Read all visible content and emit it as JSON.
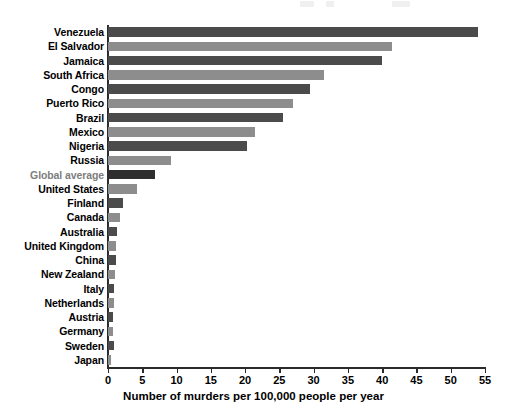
{
  "chart_data": {
    "type": "bar",
    "orientation": "horizontal",
    "title": "",
    "subtitle": "",
    "xlabel": "Number of murders per 100,000 people per year",
    "ylabel": "",
    "xlim": [
      0,
      55
    ],
    "xticks": [
      0,
      5,
      10,
      15,
      20,
      25,
      30,
      35,
      40,
      45,
      50,
      55
    ],
    "grid": false,
    "legend": "none",
    "categories": [
      "Venezuela",
      "El Salvador",
      "Jamaica",
      "South Africa",
      "Congo",
      "Puerto Rico",
      "Brazil",
      "Mexico",
      "Nigeria",
      "Russia",
      "Global average",
      "United States",
      "Finland",
      "Canada",
      "Australia",
      "United Kingdom",
      "China",
      "New Zealand",
      "Italy",
      "Netherlands",
      "Austria",
      "Germany",
      "Sweden",
      "Japan"
    ],
    "values": [
      54.0,
      41.5,
      40.0,
      31.5,
      29.5,
      27.0,
      25.5,
      21.5,
      20.3,
      9.2,
      6.9,
      4.2,
      2.2,
      1.8,
      1.3,
      1.2,
      1.1,
      1.0,
      0.9,
      0.9,
      0.8,
      0.8,
      0.9,
      0.4
    ],
    "bar_colors": [
      "#4b4b4b",
      "#8d8d8d",
      "#4b4b4b",
      "#8d8d8d",
      "#4b4b4b",
      "#8d8d8d",
      "#4b4b4b",
      "#8d8d8d",
      "#4b4b4b",
      "#8d8d8d",
      "#2e2e2e",
      "#8d8d8d",
      "#4b4b4b",
      "#8d8d8d",
      "#4b4b4b",
      "#8d8d8d",
      "#4b4b4b",
      "#8d8d8d",
      "#4b4b4b",
      "#8d8d8d",
      "#4b4b4b",
      "#8d8d8d",
      "#4b4b4b",
      "#8d8d8d"
    ],
    "highlight_category": "Global average",
    "highlight_label_color": "#7d7d7d",
    "axis_color": "#2b2b2b",
    "background_color": "#ffffff"
  }
}
